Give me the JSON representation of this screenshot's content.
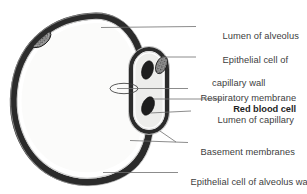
{
  "figure": {
    "style": "grayscale line drawing",
    "colors": {
      "wall_dark": "#2b2b2b",
      "lumen_light": "#f2f2f0",
      "capillary_lumen": "#e8e8e6",
      "rbc": "#1e1e1e",
      "nucleus": "#8c8c8c",
      "leader_line": "#6e6e6e",
      "text": "#404040",
      "text_strong": "#1f1f1f",
      "background": "#ffffff"
    }
  },
  "labels": [
    {
      "id": "lumen-of-alveolus",
      "text": "Lumen of alveolus",
      "lines": [
        "Lumen of alveolus"
      ],
      "emphasis": false,
      "x": 212,
      "y": 20,
      "leader": {
        "x1": 196,
        "y1": 26.5,
        "x2": 101,
        "y2": 27.5
      }
    },
    {
      "id": "epithelial-cell-of-capillary-wall",
      "text": "Epithelial cell of capillary wall",
      "lines": [
        "Epithelial cell of",
        "capillary wall"
      ],
      "emphasis": false,
      "x": 212,
      "y": 44,
      "leader": {
        "x1": 196,
        "y1": 57,
        "x2": 162,
        "y2": 57
      }
    },
    {
      "id": "respiratory-membrane",
      "text": "Respiratory membrane",
      "lines": [
        "Respiratory membrane"
      ],
      "emphasis": false,
      "x": 190,
      "y": 82,
      "leader": {
        "x1": 188,
        "y1": 88.5,
        "x2": 117,
        "y2": 88.5
      }
    },
    {
      "id": "red-blood-cell",
      "text": "Red blood cell",
      "lines": [
        "Red blood cell"
      ],
      "emphasis": true,
      "x": 223,
      "y": 93,
      "leader": {
        "x1": 221,
        "y1": 99,
        "x2": 153,
        "y2": 99
      }
    },
    {
      "id": "lumen-of-capillary",
      "text": "Lumen of capillary",
      "lines": [
        "Lumen of capillary"
      ],
      "emphasis": false,
      "x": 207,
      "y": 104,
      "leader": {
        "x1": 191,
        "y1": 111,
        "x2": 150,
        "y2": 113
      }
    },
    {
      "id": "basement-membranes",
      "text": "Basement membranes",
      "lines": [
        "Basement membranes"
      ],
      "emphasis": false,
      "x": 190,
      "y": 136,
      "leader": {
        "x1": 188,
        "y1": 142.5,
        "x2": 130,
        "y2": 140.5
      },
      "leader2": {
        "x1": 176,
        "y1": 142,
        "x2": 160,
        "y2": 131
      }
    },
    {
      "id": "epithelial-cell-of-alveolus-wall",
      "text": "Epithelial cell of alveolus wall",
      "lines": [
        "Epithelial cell of alveolus wall"
      ],
      "emphasis": false,
      "x": 180,
      "y": 166,
      "leader": {
        "x1": 178,
        "y1": 172.5,
        "x2": 103,
        "y2": 172.5
      }
    }
  ],
  "structures": [
    {
      "id": "alveolus-wall",
      "name": "alveolus wall",
      "shape": "thick irregular ring"
    },
    {
      "id": "alveolus-lumen",
      "name": "lumen of alveolus",
      "shape": "large interior space"
    },
    {
      "id": "alveolar-epithelial-nucleus",
      "name": "alveolar epithelial cell nucleus",
      "shape": "stippled oval in wall"
    },
    {
      "id": "capillary-wall",
      "name": "capillary wall",
      "shape": "elongated oval ring"
    },
    {
      "id": "capillary-lumen",
      "name": "lumen of capillary",
      "shape": "oval interior space"
    },
    {
      "id": "capillary-endothelial-nucleus",
      "name": "capillary epithelial cell nucleus",
      "shape": "stippled patch on right wall"
    },
    {
      "id": "red-blood-cell-upper",
      "name": "red blood cell (upper)",
      "shape": "dark tilted ellipse"
    },
    {
      "id": "red-blood-cell-lower",
      "name": "red blood cell (lower)",
      "shape": "dark tilted ellipse"
    },
    {
      "id": "respiratory-membrane-marker",
      "name": "respiratory membrane marker",
      "shape": "small open ellipse over fused walls"
    }
  ]
}
